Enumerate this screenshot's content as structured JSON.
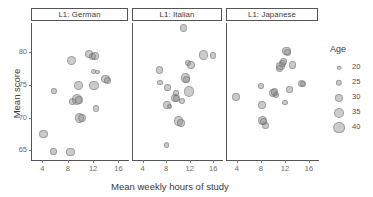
{
  "chart_data": {
    "type": "scatter",
    "title": "",
    "xlabel": "Mean weekly hours of study",
    "ylabel": "Mean score",
    "xlim": [
      2.2,
      17.5
    ],
    "ylim": [
      63.5,
      84.5
    ],
    "xticks": [
      4,
      8,
      12,
      16
    ],
    "yticks": [
      65,
      70,
      75,
      80
    ],
    "grid": false,
    "facet_variable": "L1",
    "size_legend": {
      "title": "Age",
      "position": "right",
      "breaks": [
        20,
        25,
        30,
        35,
        40
      ]
    },
    "facets": [
      {
        "label": "L1: German",
        "points": [
          {
            "x": 4.0,
            "y": 67.5,
            "age": 31
          },
          {
            "x": 5.6,
            "y": 64.8,
            "age": 26
          },
          {
            "x": 5.7,
            "y": 74.1,
            "age": 23
          },
          {
            "x": 8.3,
            "y": 64.7,
            "age": 31
          },
          {
            "x": 8.4,
            "y": 78.7,
            "age": 33
          },
          {
            "x": 8.6,
            "y": 72.5,
            "age": 28
          },
          {
            "x": 9.3,
            "y": 72.8,
            "age": 36
          },
          {
            "x": 9.5,
            "y": 74.9,
            "age": 33
          },
          {
            "x": 9.6,
            "y": 72.7,
            "age": 30
          },
          {
            "x": 9.7,
            "y": 69.9,
            "age": 34
          },
          {
            "x": 10.1,
            "y": 70.0,
            "age": 29
          },
          {
            "x": 11.2,
            "y": 79.8,
            "age": 29
          },
          {
            "x": 11.8,
            "y": 79.4,
            "age": 27
          },
          {
            "x": 11.9,
            "y": 77.1,
            "age": 21
          },
          {
            "x": 12.0,
            "y": 74.9,
            "age": 34
          },
          {
            "x": 12.2,
            "y": 79.5,
            "age": 29
          },
          {
            "x": 12.3,
            "y": 71.4,
            "age": 25
          },
          {
            "x": 12.5,
            "y": 77.0,
            "age": 20
          },
          {
            "x": 13.8,
            "y": 75.9,
            "age": 30
          },
          {
            "x": 14.1,
            "y": 75.7,
            "age": 27
          }
        ]
      },
      {
        "label": "L1: Italian",
        "points": [
          {
            "x": 6.7,
            "y": 77.3,
            "age": 27
          },
          {
            "x": 6.8,
            "y": 75.4,
            "age": 23
          },
          {
            "x": 7.9,
            "y": 65.8,
            "age": 23
          },
          {
            "x": 8.0,
            "y": 71.9,
            "age": 30
          },
          {
            "x": 8.1,
            "y": 74.6,
            "age": 26
          },
          {
            "x": 8.4,
            "y": 71.7,
            "age": 21
          },
          {
            "x": 9.3,
            "y": 73.0,
            "age": 29
          },
          {
            "x": 9.5,
            "y": 73.8,
            "age": 23
          },
          {
            "x": 9.6,
            "y": 72.9,
            "age": 25
          },
          {
            "x": 9.9,
            "y": 69.5,
            "age": 33
          },
          {
            "x": 10.3,
            "y": 69.2,
            "age": 29
          },
          {
            "x": 10.5,
            "y": 72.5,
            "age": 24
          },
          {
            "x": 10.8,
            "y": 83.7,
            "age": 28
          },
          {
            "x": 11.1,
            "y": 76.1,
            "age": 34
          },
          {
            "x": 11.3,
            "y": 75.8,
            "age": 27
          },
          {
            "x": 11.5,
            "y": 78.4,
            "age": 25
          },
          {
            "x": 11.7,
            "y": 74.0,
            "age": 35
          },
          {
            "x": 12.1,
            "y": 78.0,
            "age": 30
          },
          {
            "x": 14.2,
            "y": 79.6,
            "age": 33
          },
          {
            "x": 15.8,
            "y": 79.5,
            "age": 26
          }
        ]
      },
      {
        "label": "L1: Japanese",
        "points": [
          {
            "x": 3.7,
            "y": 73.2,
            "age": 30
          },
          {
            "x": 7.9,
            "y": 74.8,
            "age": 23
          },
          {
            "x": 8.0,
            "y": 71.9,
            "age": 29
          },
          {
            "x": 8.1,
            "y": 69.6,
            "age": 32
          },
          {
            "x": 8.3,
            "y": 69.4,
            "age": 26
          },
          {
            "x": 8.6,
            "y": 68.8,
            "age": 28
          },
          {
            "x": 9.8,
            "y": 73.8,
            "age": 30
          },
          {
            "x": 10.1,
            "y": 73.9,
            "age": 28
          },
          {
            "x": 10.3,
            "y": 73.5,
            "age": 25
          },
          {
            "x": 10.9,
            "y": 77.5,
            "age": 27
          },
          {
            "x": 11.1,
            "y": 77.9,
            "age": 30
          },
          {
            "x": 11.4,
            "y": 78.3,
            "age": 26
          },
          {
            "x": 11.6,
            "y": 78.6,
            "age": 29
          },
          {
            "x": 11.8,
            "y": 72.3,
            "age": 23
          },
          {
            "x": 12.1,
            "y": 80.2,
            "age": 31
          },
          {
            "x": 12.3,
            "y": 80.0,
            "age": 27
          },
          {
            "x": 12.6,
            "y": 74.3,
            "age": 25
          },
          {
            "x": 13.1,
            "y": 78.0,
            "age": 29
          },
          {
            "x": 14.6,
            "y": 75.2,
            "age": 27
          },
          {
            "x": 14.8,
            "y": 75.1,
            "age": 24
          }
        ]
      }
    ]
  }
}
